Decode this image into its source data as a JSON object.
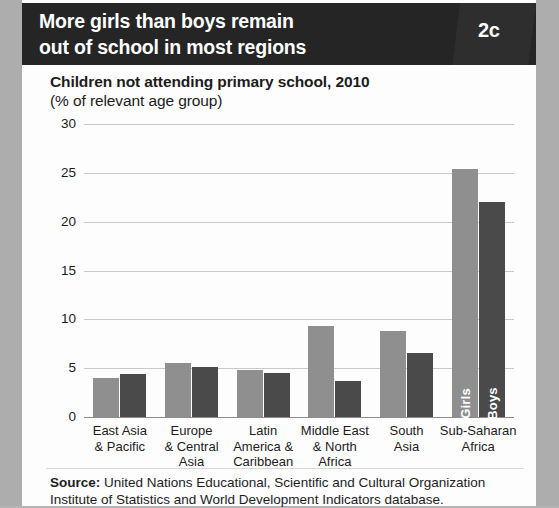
{
  "banner": {
    "title_line1": "More girls than boys remain",
    "title_line2": "out of school in most regions",
    "badge": "2c"
  },
  "caption": {
    "line1": "Children not attending primary school, 2010",
    "line2": "(% of relevant age group)"
  },
  "source": {
    "label": "Source:",
    "text": " United Nations Educational, Scientific and Cultural Organization Institute of Statistics and World Development Indicators database."
  },
  "colors": {
    "banner_bg": "#252525",
    "girls_bar": "#8f8f8f",
    "boys_bar": "#4a4a4a",
    "gridline": "#c9c9c9",
    "text": "#1c1c1c"
  },
  "chart_data": {
    "type": "bar",
    "title": "Children not attending primary school, 2010",
    "subtitle": "(% of relevant age group)",
    "xlabel": "",
    "ylabel": "",
    "ylim": [
      0,
      30
    ],
    "yticks": [
      0,
      5,
      10,
      15,
      20,
      25,
      30
    ],
    "ytick_labels": [
      "0",
      "5",
      "10",
      "15",
      "20",
      "25",
      "30"
    ],
    "grid": true,
    "legend_position": "in-bar",
    "categories": [
      "East Asia & Pacific",
      "Europe & Central Asia",
      "Latin America & Caribbean",
      "Middle East & North Africa",
      "South Asia",
      "Sub-Saharan Africa"
    ],
    "category_lines": [
      [
        "East Asia",
        "& Pacific"
      ],
      [
        "Europe",
        "& Central",
        "Asia"
      ],
      [
        "Latin",
        "America &",
        "Caribbean"
      ],
      [
        "Middle East",
        "& North",
        "Africa"
      ],
      [
        "South",
        "Asia"
      ],
      [
        "Sub-Saharan",
        "Africa"
      ]
    ],
    "series": [
      {
        "name": "Girls",
        "color": "#8f8f8f",
        "values": [
          4.0,
          5.5,
          4.8,
          9.3,
          8.8,
          25.4
        ]
      },
      {
        "name": "Boys",
        "color": "#4a4a4a",
        "values": [
          4.4,
          5.1,
          4.5,
          3.7,
          6.6,
          22.0
        ]
      }
    ],
    "inbar_labels": [
      "Girls",
      "Boys"
    ]
  }
}
